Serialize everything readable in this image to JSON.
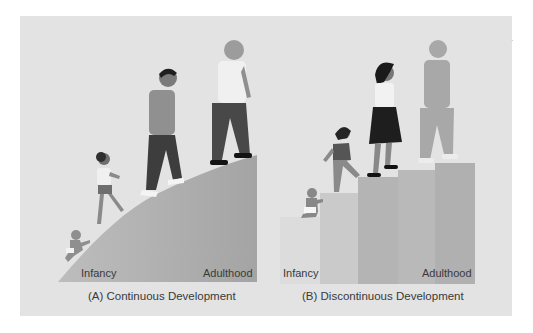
{
  "figure": {
    "panel_a": {
      "caption": "(A) Continuous Development",
      "start_label": "Infancy",
      "end_label": "Adulthood",
      "shape": "smooth-rising-slope",
      "figures": [
        "infant-crawling",
        "child-walking",
        "adolescent-walking",
        "adult-walking"
      ]
    },
    "panel_b": {
      "caption": "(B) Discontinuous Development",
      "start_label": "Infancy",
      "end_label": "Adulthood",
      "shape": "stair-steps",
      "steps": 5,
      "figures": [
        "infant-sitting",
        "child-climbing",
        "adolescent-woman-climbing",
        "adult-walking"
      ]
    }
  },
  "colors": {
    "page": "#ffffff",
    "panel_bg": "#e3e3e3",
    "slope": "#a9a9a9",
    "step_1": "#dcdcdc",
    "step_2": "#cacaca",
    "step_3": "#b4b4b4",
    "step_4": "#b9b9b9",
    "step_5": "#b0b0b0",
    "text": "#3a3a3a"
  },
  "stray_mark": "·"
}
